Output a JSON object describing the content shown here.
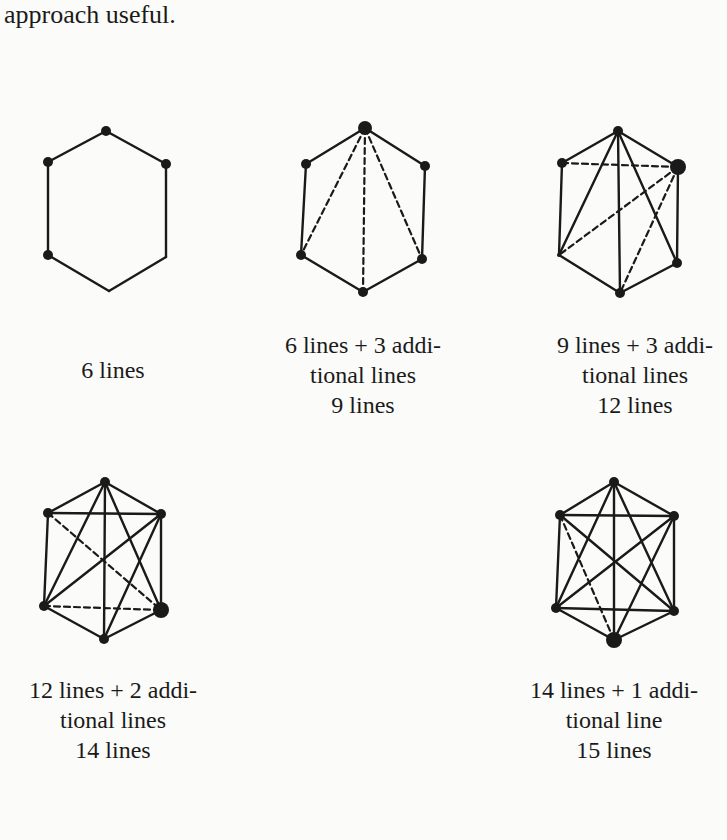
{
  "page": {
    "top_text": "approach useful."
  },
  "figures": [
    {
      "id": "fig1",
      "box": {
        "x": 20,
        "y": 100
      },
      "vertices": [
        [
          86,
          31
        ],
        [
          28,
          62
        ],
        [
          146,
          64
        ],
        [
          28,
          155
        ],
        [
          146,
          157
        ],
        [
          89,
          191
        ]
      ],
      "vertex_r": [
        5,
        5,
        5,
        5,
        0,
        0
      ],
      "solid": [
        [
          0,
          1
        ],
        [
          0,
          2
        ],
        [
          1,
          3
        ],
        [
          2,
          4
        ],
        [
          3,
          5
        ],
        [
          4,
          5
        ]
      ],
      "dashed": [],
      "caption_lines": [
        "6 lines"
      ],
      "caption_pos": {
        "cx": 113,
        "y": 355
      }
    },
    {
      "id": "fig2",
      "box": {
        "x": 270,
        "y": 100
      },
      "vertices": [
        [
          95,
          28
        ],
        [
          36,
          64
        ],
        [
          155,
          66
        ],
        [
          31,
          155
        ],
        [
          152,
          159
        ],
        [
          93,
          192
        ]
      ],
      "vertex_r": [
        7,
        5,
        5,
        5,
        5,
        5
      ],
      "solid": [
        [
          0,
          1
        ],
        [
          0,
          2
        ],
        [
          1,
          3
        ],
        [
          2,
          4
        ],
        [
          3,
          5
        ],
        [
          4,
          5
        ]
      ],
      "dashed": [
        [
          0,
          3
        ],
        [
          0,
          4
        ],
        [
          0,
          5
        ]
      ],
      "caption_lines": [
        "6 lines + 3 addi-",
        "tional lines",
        "9 lines"
      ],
      "caption_pos": {
        "cx": 363,
        "y": 330
      }
    },
    {
      "id": "fig3",
      "box": {
        "x": 530,
        "y": 100
      },
      "vertices": [
        [
          88,
          31
        ],
        [
          32,
          63
        ],
        [
          148,
          67
        ],
        [
          29,
          155
        ],
        [
          147,
          163
        ],
        [
          90,
          193
        ]
      ],
      "vertex_r": [
        5,
        5,
        8,
        2,
        5,
        5
      ],
      "solid": [
        [
          0,
          1
        ],
        [
          0,
          2
        ],
        [
          1,
          3
        ],
        [
          2,
          4
        ],
        [
          3,
          5
        ],
        [
          4,
          5
        ],
        [
          0,
          3
        ],
        [
          0,
          5
        ],
        [
          0,
          4
        ]
      ],
      "dashed": [
        [
          1,
          2
        ],
        [
          2,
          3
        ],
        [
          2,
          5
        ]
      ],
      "caption_lines": [
        "9 lines + 3 addi-",
        "tional lines",
        "12 lines"
      ],
      "caption_pos": {
        "cx": 635,
        "y": 330
      }
    },
    {
      "id": "fig4",
      "box": {
        "x": 0,
        "y": 440
      },
      "vertices": [
        [
          105,
          42
        ],
        [
          48,
          73
        ],
        [
          161,
          74
        ],
        [
          44,
          166
        ],
        [
          161,
          170
        ],
        [
          104,
          199
        ]
      ],
      "vertex_r": [
        5,
        5,
        5,
        5,
        8,
        5
      ],
      "solid": [
        [
          0,
          1
        ],
        [
          0,
          2
        ],
        [
          1,
          3
        ],
        [
          2,
          4
        ],
        [
          3,
          5
        ],
        [
          4,
          5
        ],
        [
          0,
          3
        ],
        [
          0,
          5
        ],
        [
          0,
          4
        ],
        [
          1,
          2
        ],
        [
          2,
          3
        ],
        [
          2,
          5
        ]
      ],
      "dashed": [
        [
          1,
          4
        ],
        [
          3,
          4
        ]
      ],
      "caption_lines": [
        "12 lines + 2 addi-",
        "tional lines",
        "14 lines"
      ],
      "caption_pos": {
        "cx": 113,
        "y": 675
      }
    },
    {
      "id": "fig5",
      "box": {
        "x": 500,
        "y": 440
      },
      "vertices": [
        [
          114,
          42
        ],
        [
          60,
          75
        ],
        [
          174,
          76
        ],
        [
          56,
          168
        ],
        [
          174,
          171
        ],
        [
          114,
          200
        ]
      ],
      "vertex_r": [
        5,
        5,
        5,
        5,
        5,
        8
      ],
      "solid": [
        [
          0,
          1
        ],
        [
          0,
          2
        ],
        [
          1,
          3
        ],
        [
          2,
          4
        ],
        [
          3,
          5
        ],
        [
          4,
          5
        ],
        [
          0,
          3
        ],
        [
          0,
          5
        ],
        [
          0,
          4
        ],
        [
          1,
          2
        ],
        [
          2,
          3
        ],
        [
          2,
          5
        ],
        [
          1,
          4
        ],
        [
          3,
          4
        ]
      ],
      "dashed": [
        [
          1,
          5
        ]
      ],
      "caption_lines": [
        "14 lines + 1 addi-",
        "tional line",
        "15 lines"
      ],
      "caption_pos": {
        "cx": 614,
        "y": 675
      }
    }
  ],
  "style": {
    "stroke": "#1a1a1a",
    "background": "#fbfbf9"
  }
}
